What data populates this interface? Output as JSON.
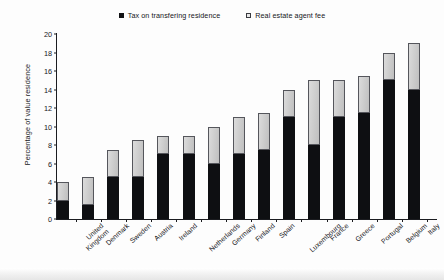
{
  "chart_data": {
    "type": "bar",
    "subtype": "stacked-bar",
    "title": "",
    "xlabel": "",
    "ylabel": "Percentage of value residence",
    "ylim": [
      0,
      20
    ],
    "ytick_step": 2,
    "yticks": [
      0,
      2,
      4,
      6,
      8,
      10,
      12,
      14,
      16,
      18,
      20
    ],
    "grid": false,
    "legend_position": "top-center",
    "categories": [
      "United Kingdom",
      "Denmark",
      "Sweden",
      "Austria",
      "Ireland",
      "Netherlands",
      "Germany",
      "Finland",
      "Spain",
      "Luxembourg",
      "France",
      "Greece",
      "Portugal",
      "Belgium",
      "Italy"
    ],
    "series": [
      {
        "name": "Tax on transfering residence",
        "color": "#0e0f12",
        "values": [
          2,
          1.5,
          4.5,
          4.5,
          7,
          7,
          6,
          7,
          7.5,
          11,
          8,
          11,
          11.5,
          15,
          14
        ]
      },
      {
        "name": "Real estate agent fee",
        "color": "#c9c9c9",
        "values": [
          2,
          3,
          3,
          4,
          2,
          2,
          4,
          4,
          4,
          3,
          7,
          4,
          4,
          3,
          5
        ]
      }
    ],
    "totals": [
      4,
      4.5,
      7.5,
      8.5,
      9,
      9,
      10,
      11,
      11.5,
      14,
      15,
      15,
      15.5,
      18,
      19
    ]
  },
  "legend": {
    "items": [
      {
        "label": "Tax on transfering residence",
        "marker": "filled-square-black"
      },
      {
        "label": "Real estate agent fee",
        "marker": "outlined-square-gray"
      }
    ]
  },
  "axes": {
    "y_title": "Percentage of value residence",
    "y_tick_labels": [
      "20",
      "18",
      "16",
      "14",
      "12",
      "10",
      "8",
      "6",
      "4",
      "2",
      "0"
    ]
  }
}
